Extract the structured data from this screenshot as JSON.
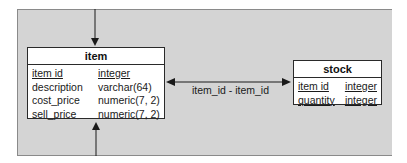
{
  "diagram": {
    "entities": [
      {
        "name": "item",
        "columns": [
          {
            "name": "item id",
            "type": "integer",
            "key": true
          },
          {
            "name": "description",
            "type": "varchar(64)",
            "key": false
          },
          {
            "name": "cost_price",
            "type": "numeric(7, 2)",
            "key": false
          },
          {
            "name": "sell_price",
            "type": "numeric(7, 2)",
            "key": false
          }
        ]
      },
      {
        "name": "stock",
        "columns": [
          {
            "name": "item id",
            "type": "integer",
            "key": true
          },
          {
            "name": "quantity",
            "type": "integer",
            "key": true
          }
        ]
      }
    ],
    "relationship": {
      "label": "item_id - item_id",
      "from": "item",
      "to": "stock",
      "bidirectional": true
    },
    "external_arrows": [
      {
        "target": "item",
        "side": "top",
        "direction": "in"
      },
      {
        "target": "item",
        "side": "bottom",
        "direction": "in"
      }
    ],
    "colors": {
      "background": "#d4d4d4",
      "entity_fill": "#ffffff",
      "line": "#1a1a1a"
    }
  }
}
